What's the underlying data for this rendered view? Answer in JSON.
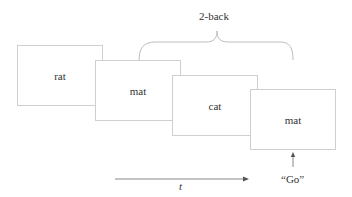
{
  "diagram": {
    "brace_label": "2-back",
    "cards": [
      {
        "word": "rat"
      },
      {
        "word": "mat"
      },
      {
        "word": "cat"
      },
      {
        "word": "mat"
      }
    ],
    "time_axis_label": "t",
    "response_label": "“Go”"
  },
  "colors": {
    "card_border": "#cfcfcf",
    "line": "#999999",
    "text": "#333333"
  }
}
